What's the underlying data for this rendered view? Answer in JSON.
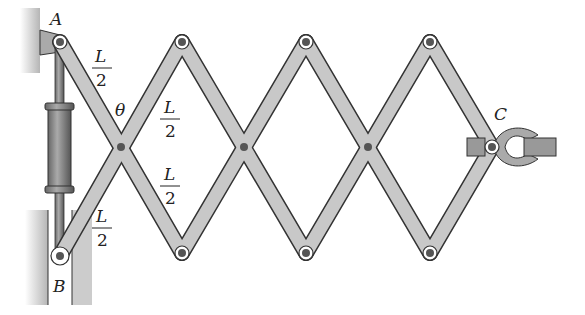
{
  "diagram": {
    "labels": {
      "A": "A",
      "B": "B",
      "C": "C",
      "theta": "θ"
    },
    "segment_labels": [
      {
        "num": "L",
        "den": "2",
        "x": 100,
        "y": 58
      },
      {
        "num": "L",
        "den": "2",
        "x": 170,
        "y": 110
      },
      {
        "num": "L",
        "den": "2",
        "x": 170,
        "y": 180
      },
      {
        "num": "L",
        "den": "2",
        "x": 100,
        "y": 218
      }
    ],
    "colors": {
      "bar_fill": "#c8c8c8",
      "bar_stroke": "#333333",
      "wall": "#bdbdbd",
      "pin": "#555555",
      "cylinder": "#8a8a8a"
    }
  }
}
